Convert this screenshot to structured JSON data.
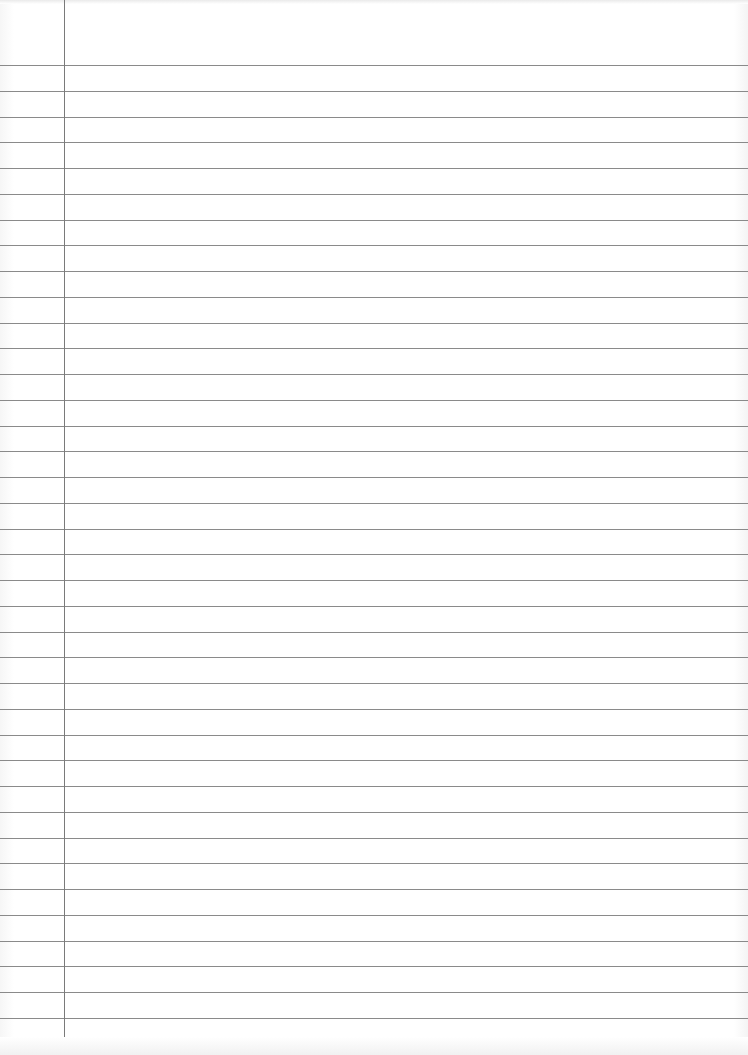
{
  "page": {
    "type": "lined-notebook-paper",
    "width": 748,
    "height": 1055,
    "background_color": "#ffffff",
    "rule_color": "#8a8a8a",
    "margin_color": "#7a7a7a"
  },
  "rules": {
    "count": 38,
    "first_y": 65,
    "spacing": 25.75
  },
  "margin_line": {
    "x": 64,
    "top": 0,
    "bottom": 1050
  },
  "text": []
}
